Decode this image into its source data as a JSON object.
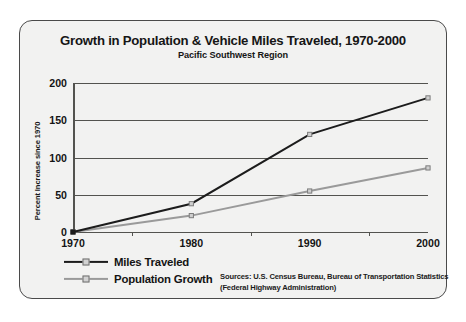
{
  "chart_data": {
    "type": "line",
    "title": "Growth in Population & Vehicle Miles Traveled, 1970-2000",
    "subtitle": "Pacific Southwest Region",
    "xlabel": "",
    "ylabel": "Percent Increase since 1970",
    "categories": [
      "1970",
      "1980",
      "1990",
      "2000"
    ],
    "x": [
      1970,
      1980,
      1990,
      2000
    ],
    "ylim": [
      0,
      200
    ],
    "yticks": [
      0,
      50,
      100,
      150,
      200
    ],
    "grid": "horizontal",
    "legend_position": "bottom-left",
    "series": [
      {
        "name": "Miles Traveled",
        "values": [
          0,
          38,
          131,
          180
        ],
        "color": "#1c1c1c"
      },
      {
        "name": "Population Growth",
        "values": [
          0,
          22,
          55,
          86
        ],
        "color": "#9a9a9a"
      }
    ],
    "annotations": [
      "Sources: U.S. Census Bureau, Bureau of Transportation Statistics",
      "(Federal Highway Administration)"
    ]
  },
  "sources": {
    "line1": "Sources: U.S. Census Bureau, Bureau of Transportation Statistics",
    "line2": "(Federal Highway Administration)"
  },
  "colors": {
    "miles_traveled": "#1c1c1c",
    "population_growth": "#9a9a9a",
    "axis": "#53534f",
    "panel_background": "#f2f2f1",
    "panel_border": "#4a4a4a"
  }
}
